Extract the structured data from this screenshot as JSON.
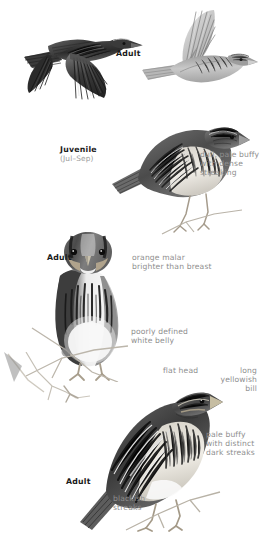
{
  "plate": {
    "title": "Sparrow identification plate",
    "background_color": "#ffffff",
    "label_color_bold": "#1b1b1b",
    "label_color_note": "#8e8e8e",
    "width": 263,
    "height": 534
  },
  "figures": [
    {
      "id": "flight-upper",
      "name": "adult-in-flight-upperside",
      "age_label": "Adult",
      "view": "upperside, flying right, wings down"
    },
    {
      "id": "flight-under",
      "name": "adult-in-flight-underside",
      "view": "underside, flying right, wings raised"
    },
    {
      "id": "juvenile-perched",
      "name": "juvenile-perched",
      "age_label": "Juvenile",
      "season_label": "(Jul–Sep)"
    },
    {
      "id": "adult-frontal",
      "name": "adult-frontal-perched",
      "age_label": "Adult"
    },
    {
      "id": "adult-side",
      "name": "adult-side-perched",
      "age_label": "Adult"
    }
  ],
  "labels": {
    "adult_flight": "Adult",
    "juvenile": "Juvenile",
    "juvenile_season": "(Jul–Sep)",
    "adult_frontal": "Adult",
    "adult_side": "Adult"
  },
  "annotations": {
    "juvenile_plumage": "dull, pale buffy\nwith dense\nstreaking",
    "orange_malar": "orange malar\nbrighter than breast",
    "white_belly": "poorly defined\nwhite belly",
    "flat_head": "flat head",
    "long_bill": "long\nyellowish\nbill",
    "pale_buffy": "pale buffy\nwith distinct\ndark streaks",
    "blackish_streaks": "blackish\nstreaks"
  }
}
